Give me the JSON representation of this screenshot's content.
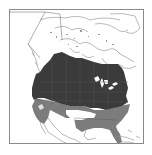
{
  "map": {
    "type": "species-range-map",
    "region": "North America",
    "colors": {
      "background": "#ffffff",
      "frame": "#8a8a8a",
      "land_outline": "#8c8c8c",
      "primary_range": "#3b3b3b",
      "secondary_range": "#7c7c7c",
      "internal_borders": "#555555"
    },
    "legend": []
  }
}
